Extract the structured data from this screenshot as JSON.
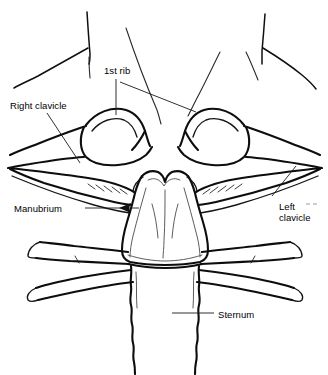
{
  "figure": {
    "name": "sternoclavicular-region-line-drawing",
    "view": "anterior",
    "style": "black-and-white line drawing",
    "background_color": "#ffffff",
    "line_color": "#0d0d0d",
    "leader_color": "#1a1a1a",
    "width": 328,
    "height": 375
  },
  "labels": [
    {
      "id": "first-rib",
      "text": "1st rib",
      "x": 104,
      "y": 65,
      "align": "left",
      "leader": "two-lines",
      "leader_targets": [
        "right-first-rib-shaft",
        "left-first-rib-shaft"
      ]
    },
    {
      "id": "right-clavicle",
      "text": "Right clavicle",
      "x": 10,
      "y": 100,
      "align": "left",
      "leader": "diagonal-down-right",
      "leader_targets": [
        "right-clavicle-body"
      ]
    },
    {
      "id": "manubrium",
      "text": "Manubrium",
      "x": 14,
      "y": 203,
      "align": "left",
      "leader": "horizontal-with-arrowhead",
      "leader_targets": [
        "manubrium-lateral-border"
      ]
    },
    {
      "id": "left-clavicle",
      "text": "Left\nclavicle",
      "line1": "Left",
      "line2": "clavicle",
      "x": 279,
      "y": 201,
      "align": "left",
      "leader": "diagonal-up-left",
      "leader_targets": [
        "left-clavicle-body"
      ]
    },
    {
      "id": "sternum",
      "text": "Sternum",
      "x": 218,
      "y": 309,
      "align": "left",
      "leader": "horizontal-left",
      "leader_targets": [
        "sternal-body"
      ]
    }
  ],
  "anatomy": {
    "structures": [
      {
        "id": "manubrium",
        "name": "Manubrium of sternum",
        "labeled": true
      },
      {
        "id": "sternal-body",
        "name": "Body of sternum",
        "labeled": true
      },
      {
        "id": "right-clavicle",
        "name": "Right clavicle",
        "labeled": true
      },
      {
        "id": "left-clavicle",
        "name": "Left clavicle",
        "labeled": true
      },
      {
        "id": "right-first-rib",
        "name": "Right 1st rib",
        "labeled": true
      },
      {
        "id": "left-first-rib",
        "name": "Left 1st rib",
        "labeled": true
      },
      {
        "id": "right-costal-cartilages",
        "name": "Right costal cartilages",
        "labeled": false
      },
      {
        "id": "left-costal-cartilages",
        "name": "Left costal cartilages",
        "labeled": false
      },
      {
        "id": "jugular-notch",
        "name": "Jugular (suprasternal) notch",
        "labeled": false
      },
      {
        "id": "neck-soft-tissue",
        "name": "Neck and shoulder soft tissue outlines",
        "labeled": false
      }
    ]
  }
}
